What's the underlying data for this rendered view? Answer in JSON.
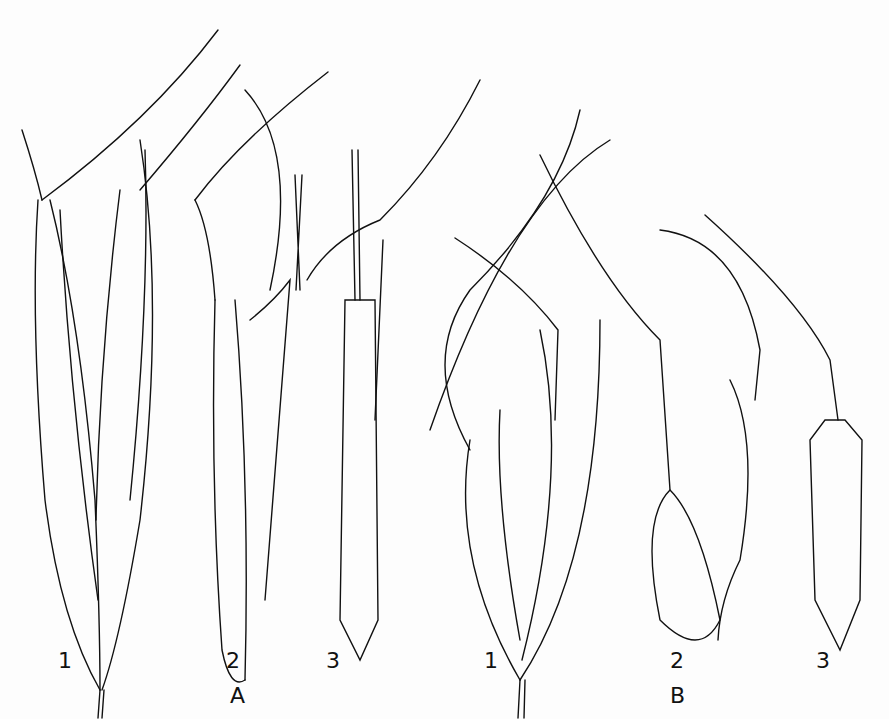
{
  "figure": {
    "groups": [
      {
        "id": "A",
        "label": "A",
        "items": [
          {
            "label": "1"
          },
          {
            "label": "2"
          },
          {
            "label": "3"
          }
        ]
      },
      {
        "id": "B",
        "label": "B",
        "items": [
          {
            "label": "1"
          },
          {
            "label": "2"
          },
          {
            "label": "3"
          }
        ]
      }
    ],
    "colors": {
      "ink": "#111111",
      "paper": "#fdfdfd"
    }
  }
}
